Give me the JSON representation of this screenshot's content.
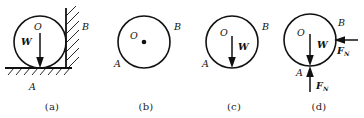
{
  "figure": {
    "type": "physics-free-body-diagram-set",
    "background_color": "#ffffff",
    "stroke_color": "#111111",
    "panel_count": 4
  },
  "panels": [
    {
      "id": "a",
      "caption": "(a)",
      "description": "Ball resting on hatched ground against hatched vertical wall",
      "labels": {
        "center": "O",
        "weight": "W",
        "contact_wall": "B",
        "contact_ground": "A"
      },
      "has_ground": true,
      "has_wall": true,
      "has_weight_arrow": true,
      "has_center_dot": false,
      "forces": []
    },
    {
      "id": "b",
      "caption": "(b)",
      "description": "Isolated ball with center point marked",
      "labels": {
        "center": "O",
        "contact_wall": "B",
        "contact_ground": "A"
      },
      "has_ground": false,
      "has_wall": false,
      "has_weight_arrow": false,
      "has_center_dot": true,
      "forces": []
    },
    {
      "id": "c",
      "caption": "(c)",
      "description": "Isolated ball with weight vector applied at center",
      "labels": {
        "center": "O",
        "weight": "W",
        "contact_wall": "B",
        "contact_ground": "A"
      },
      "has_ground": false,
      "has_wall": false,
      "has_weight_arrow": true,
      "has_center_dot": false,
      "forces": []
    },
    {
      "id": "d",
      "caption": "(d)",
      "description": "Complete free-body diagram with weight and two normal forces",
      "labels": {
        "center": "O",
        "weight": "W",
        "contact_wall": "B",
        "contact_ground": "A"
      },
      "has_ground": false,
      "has_wall": false,
      "has_weight_arrow": true,
      "has_center_dot": false,
      "forces": [
        {
          "symbol": "F",
          "subscript": "N",
          "point": "B",
          "direction": "left",
          "description": "Normal force from wall at contact point B"
        },
        {
          "symbol": "F",
          "subscript": "N",
          "point": "A",
          "direction": "up",
          "description": "Normal force from ground at contact point A"
        }
      ]
    }
  ]
}
